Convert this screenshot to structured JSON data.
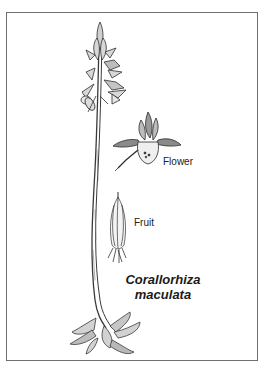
{
  "plate": {
    "species_name_line1": "Corallorhiza",
    "species_name_line2": "maculata",
    "labels": {
      "flower": "Flower",
      "fruit": "Fruit"
    },
    "colors": {
      "border": "#6f6f6f",
      "ink": "#2a2a2a",
      "background": "#ffffff"
    }
  }
}
